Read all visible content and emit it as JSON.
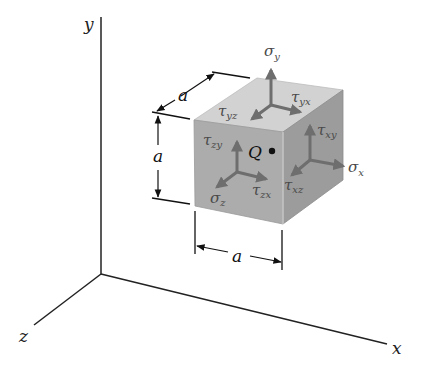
{
  "diagram": {
    "axes": {
      "x_label": "x",
      "y_label": "y",
      "z_label": "z"
    },
    "cube": {
      "side_label": "a",
      "dimension_labels": [
        "a",
        "a",
        "a"
      ],
      "point_label": "Q",
      "colors": {
        "top_face": "#d2d2d2",
        "front_face": "#acacac",
        "right_face": "#9c9c9c",
        "arrow": "#6e6e6e"
      }
    },
    "faces": {
      "top": {
        "normal": {
          "symbol": "σ",
          "sub": "y"
        },
        "shear_1": {
          "symbol": "τ",
          "sub": "yx"
        },
        "shear_2": {
          "symbol": "τ",
          "sub": "yz"
        }
      },
      "front": {
        "normal": {
          "symbol": "σ",
          "sub": "z"
        },
        "shear_1": {
          "symbol": "τ",
          "sub": "zx"
        },
        "shear_2": {
          "symbol": "τ",
          "sub": "zy"
        }
      },
      "right": {
        "normal": {
          "symbol": "σ",
          "sub": "x"
        },
        "shear_1": {
          "symbol": "τ",
          "sub": "xy"
        },
        "shear_2": {
          "symbol": "τ",
          "sub": "xz"
        }
      }
    }
  }
}
